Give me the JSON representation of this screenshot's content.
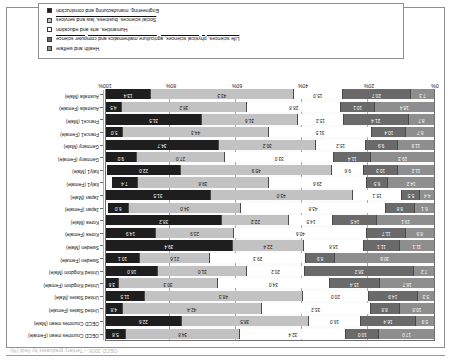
{
  "page": {
    "header_note": "OECD 2008 – Tertiary graduates by field (%)"
  },
  "legend": {
    "items": [
      {
        "key": "health",
        "label": "Health and welfare",
        "color": "#8e8e8e"
      },
      {
        "key": "science",
        "label": "Life sciences, physical sciences, agriculture,mathematics and computer science",
        "color": "#6a6a6a"
      },
      {
        "key": "humanities",
        "label": "Humanities, arts and education",
        "color": "#ffffff"
      },
      {
        "key": "social",
        "label": "Social sciences, business, law and services",
        "color": "#c2c2c2"
      },
      {
        "key": "engineering",
        "label": "Engineering, manufacturing and construction",
        "color": "#1e1e1e"
      }
    ]
  },
  "axis": {
    "ticks": [
      "0%",
      "20%",
      "40%",
      "60%",
      "80%",
      "100%"
    ],
    "tick_values": [
      0,
      20,
      40,
      60,
      80,
      100
    ]
  },
  "chart_data": {
    "type": "bar",
    "orientation": "horizontal",
    "stacked": true,
    "title": "",
    "xlabel": "",
    "ylabel": "",
    "xlim": [
      0,
      100
    ],
    "grid": true,
    "legend_position": "bottom",
    "categories": [
      "OECD Countries mean (Female)",
      "OECD Countries mean (Male)",
      "United States (Female)",
      "United States (Male)",
      "United Kingdom (Female)",
      "United Kingdom (Male)",
      "Sweden (Female)",
      "Sweden (Male)",
      "Korea (Female)",
      "Korea (Male)",
      "Japan (Female)",
      "Japan (Male)",
      "Italy1 (Female)",
      "Italy1 (Male)",
      "Germany (Female)",
      "Germany (Male)",
      "France1 (Female)",
      "France1 (Male)",
      "Australia (Female)",
      "Australia (Male)"
    ],
    "series": [
      {
        "name": "Health and welfare",
        "color": "#8e8e8e",
        "values": [
          17.0,
          5.9,
          10.8,
          5.3,
          16.7,
          7.2,
          30.6,
          11.1,
          8.9,
          19.1,
          6.1,
          4.4,
          14.2,
          11.2,
          19.3,
          11.6,
          8.7,
          8.7,
          18.4,
          7.3
        ]
      },
      {
        "name": "Life sciences, physical sciences, agriculture,mathematics and computer science",
        "color": "#6a6a6a",
        "values": [
          10.0,
          16.4,
          8.8,
          14.9,
          15.4,
          38.2,
          8.9,
          11.1,
          11.7,
          14.5,
          8.8,
          5.5,
          6.5,
          10.3,
          11.4,
          9.9,
          10.4,
          21.4,
          10.1,
          20.7
        ]
      },
      {
        "name": "Humanities, arts and education",
        "color": "#ffffff",
        "values": [
          32.4,
          16.0,
          33.2,
          20.0,
          34.0,
          20.2,
          29.3,
          18.8,
          40.6,
          14.5,
          43.8,
          15.1,
          29.6,
          9.6,
          33.0,
          15.2,
          31.5,
          15.2,
          28.8,
          15.0
        ]
      },
      {
        "name": "Social sciences, business, law and services",
        "color": "#c2c2c2",
        "values": [
          34.8,
          38.5,
          42.4,
          48.3,
          30.3,
          31.0,
          21.6,
          22.4,
          23.9,
          22.2,
          34.0,
          43.0,
          39.8,
          45.9,
          27.0,
          30.2,
          44.3,
          31.6,
          38.2,
          43.3
        ]
      },
      {
        "name": "Engineering, manufacturing and construction",
        "color": "#1e1e1e",
        "values": [
          5.8,
          22.6,
          4.8,
          11.5,
          3.6,
          18.0,
          10.1,
          39.4,
          14.9,
          38.2,
          6.0,
          31.5,
          7.4,
          22.0,
          9.0,
          34.7,
          5.0,
          31.5,
          4.5,
          13.4
        ]
      }
    ]
  }
}
